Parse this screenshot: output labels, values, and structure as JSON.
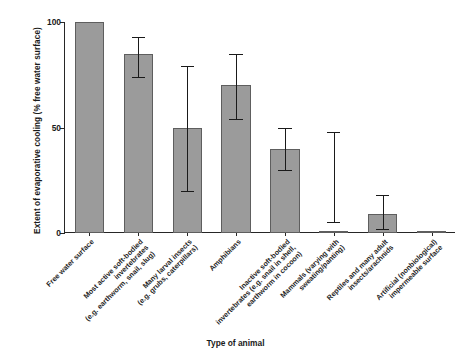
{
  "chart_data": {
    "type": "bar",
    "title": "",
    "xlabel": "Type of animal",
    "ylabel": "Extent of evaporative cooling (% free water surface)",
    "ylim": [
      0,
      100
    ],
    "yticks": [
      0,
      50,
      100
    ],
    "yticklabels": [
      "0",
      "50",
      "100"
    ],
    "grid": false,
    "legend": "none",
    "categories": [
      "Free water surface",
      "Most active soft-bodied invertebrates (e.g. earthworm, snail, slug)",
      "Many larval insects (e.g. grubs, caterpillars)",
      "Amphibians",
      "Inactive soft-bodied invertebrates (e.g. snail in shell, earthworm in cocoon)",
      "Mammals (varying with sweating/panting)",
      "Reptiles and many adult insects/arachnids",
      "Artificial (nonbiological) impermeable surface"
    ],
    "category_lines": [
      [
        "Free water surface"
      ],
      [
        "Most active soft-bodied",
        "invertebrates",
        "(e.g. earthworm, snail, slug)"
      ],
      [
        "Many larval insects",
        "(e.g. grubs, caterpillars)"
      ],
      [
        "Amphibians"
      ],
      [
        "Inactive soft-bodied",
        "invertebrates (e.g. snail in shell,",
        "earthworm in cocoon)"
      ],
      [
        "Mammals (varying with",
        "sweating/panting)"
      ],
      [
        "Reptiles and many adult",
        "insects/arachnids"
      ],
      [
        "Artificial (nonbiological)",
        "impermeable surface"
      ]
    ],
    "values": [
      100,
      85,
      50,
      70,
      40,
      0,
      9,
      1
    ],
    "error_low": [
      100,
      74,
      20,
      54,
      30,
      5,
      2,
      1
    ],
    "error_high": [
      100,
      93,
      79,
      85,
      50,
      48,
      18,
      1
    ],
    "has_error_bar": [
      false,
      true,
      true,
      true,
      true,
      true,
      true,
      false
    ],
    "bar_color": "#9b9b9b",
    "bar_edge_color": "#5e5e5e",
    "axis_color": "#262626",
    "error_color": "#1a1a1a"
  }
}
